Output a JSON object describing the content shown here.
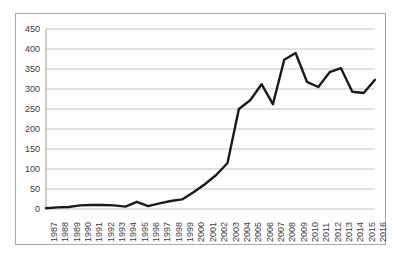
{
  "chart_data": {
    "type": "line",
    "title": "",
    "subtitle": "",
    "xlabel": "",
    "ylabel": "",
    "legend": [],
    "legend_position": "none",
    "grid": "horizontal",
    "ylim": [
      0,
      450
    ],
    "ytick_labels": [
      "0",
      "50",
      "100",
      "150",
      "200",
      "250",
      "300",
      "350",
      "400",
      "450"
    ],
    "ytick_values": [
      0,
      50,
      100,
      150,
      200,
      250,
      300,
      350,
      400,
      450
    ],
    "categories": [
      "1987",
      "1988",
      "1989",
      "1990",
      "1991",
      "1992",
      "1993",
      "1994",
      "1995",
      "1996",
      "1997",
      "1998",
      "1999",
      "2000",
      "2001",
      "2002",
      "2003",
      "2004",
      "2005",
      "2006",
      "2007",
      "2008",
      "2009",
      "2010",
      "2011",
      "2012",
      "2013",
      "2014",
      "2015",
      "2016"
    ],
    "values": [
      2,
      4,
      5,
      9,
      10,
      10,
      9,
      6,
      18,
      7,
      14,
      20,
      24,
      42,
      62,
      85,
      115,
      250,
      272,
      312,
      262,
      373,
      390,
      318,
      305,
      342,
      352,
      293,
      290,
      323
    ],
    "series": [
      {
        "name": "series-1",
        "color": "#1a1a1a",
        "line_width": 2.4,
        "values": [
          2,
          4,
          5,
          9,
          10,
          10,
          9,
          6,
          18,
          7,
          14,
          20,
          24,
          42,
          62,
          85,
          115,
          250,
          272,
          312,
          262,
          373,
          390,
          318,
          305,
          342,
          352,
          293,
          290,
          323
        ]
      }
    ],
    "colors": {
      "line": "#1a1a1a",
      "gridline": "#c3c3c3",
      "axis": "#9a9a9a",
      "frame_border": "#a8a8a8",
      "tick_text": "#3a3a3a",
      "background": "#ffffff"
    }
  }
}
